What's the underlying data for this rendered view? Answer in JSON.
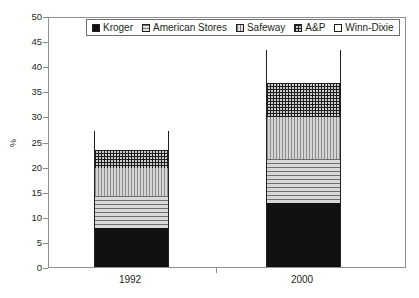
{
  "chart_data": {
    "type": "bar",
    "subtype": "stacked-bar",
    "title": "",
    "xlabel": "",
    "ylabel": "%",
    "categories": [
      "1992",
      "2000"
    ],
    "ylim": [
      0,
      50
    ],
    "ytick_step": 5,
    "ytick_labels": [
      "0",
      "5",
      "10",
      "15",
      "20",
      "25",
      "30",
      "35",
      "40",
      "45",
      "50"
    ],
    "grid": false,
    "legend_position": "top-center",
    "series": [
      {
        "name": "Kroger",
        "values": [
          7.8,
          12.7
        ],
        "pattern": "solid-black",
        "color": "#111111"
      },
      {
        "name": "American Stores",
        "values": [
          6.4,
          8.9
        ],
        "pattern": "horizontal-lines",
        "color": "#c9c9c9"
      },
      {
        "name": "Safeway",
        "values": [
          5.6,
          8.2
        ],
        "pattern": "vertical-lines",
        "color": "#c9c9c9"
      },
      {
        "name": "A&P",
        "values": [
          3.6,
          6.9
        ],
        "pattern": "crosshatch-grid",
        "color": "#cccccc"
      },
      {
        "name": "Winn-Dixie",
        "values": [
          3.7,
          6.5
        ],
        "pattern": "empty-white",
        "color": "#ffffff"
      }
    ],
    "cumulative_tops": {
      "1992": [
        7.8,
        14.2,
        19.8,
        23.4,
        27.1
      ],
      "2000": [
        12.7,
        21.6,
        29.8,
        36.7,
        43.2
      ]
    },
    "totals": [
      27.1,
      43.2
    ]
  },
  "legend": {
    "items": [
      {
        "label": "Kroger"
      },
      {
        "label": "American Stores"
      },
      {
        "label": "Safeway"
      },
      {
        "label": "A&P"
      },
      {
        "label": "Winn-Dixie"
      }
    ]
  }
}
